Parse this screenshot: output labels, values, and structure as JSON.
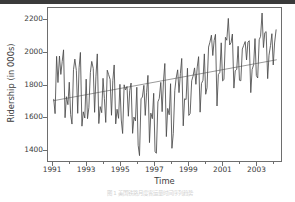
{
  "figure": {
    "background_color": "#ffffff",
    "axes_color": "#6e6e6e",
    "text_color": "#3b3b3b"
  },
  "caption": {
    "text": "图 1  美国铁路月度客运量时间序列趋势"
  },
  "chart_data": {
    "type": "line",
    "title": "",
    "xlabel": "Time",
    "ylabel": "Ridership (in 000s)",
    "xlim": [
      1990.7,
      2004.5
    ],
    "ylim": [
      1330,
      2270
    ],
    "grid": false,
    "legend": "none",
    "xticks": [
      1991,
      1993,
      1995,
      1997,
      1999,
      2001,
      2003
    ],
    "xticks_minor": [
      1992,
      1994,
      1996,
      1998,
      2000,
      2002,
      2004
    ],
    "yticks": [
      1400,
      1600,
      1800,
      2000,
      2200
    ],
    "series": [
      {
        "name": "Ridership",
        "color": "#4a4a4a",
        "linewidth": 0.85,
        "x": [
          1991.04,
          1991.12,
          1991.21,
          1991.29,
          1991.38,
          1991.46,
          1991.54,
          1991.62,
          1991.71,
          1991.79,
          1991.88,
          1991.96,
          1992.04,
          1992.12,
          1992.21,
          1992.29,
          1992.38,
          1992.46,
          1992.54,
          1992.62,
          1992.71,
          1992.79,
          1992.88,
          1992.96,
          1993.04,
          1993.12,
          1993.21,
          1993.29,
          1993.38,
          1993.46,
          1993.54,
          1993.62,
          1993.71,
          1993.79,
          1993.88,
          1993.96,
          1994.04,
          1994.12,
          1994.21,
          1994.29,
          1994.38,
          1994.46,
          1994.54,
          1994.62,
          1994.71,
          1994.79,
          1994.88,
          1994.96,
          1995.04,
          1995.12,
          1995.21,
          1995.29,
          1995.38,
          1995.46,
          1995.54,
          1995.62,
          1995.71,
          1995.79,
          1995.88,
          1995.96,
          1996.04,
          1996.12,
          1996.21,
          1996.29,
          1996.38,
          1996.46,
          1996.54,
          1996.62,
          1996.71,
          1996.79,
          1996.88,
          1996.96,
          1997.04,
          1997.12,
          1997.21,
          1997.29,
          1997.38,
          1997.46,
          1997.54,
          1997.62,
          1997.71,
          1997.79,
          1997.88,
          1997.96,
          1998.04,
          1998.12,
          1998.21,
          1998.29,
          1998.38,
          1998.46,
          1998.54,
          1998.62,
          1998.71,
          1998.79,
          1998.88,
          1998.96,
          1999.04,
          1999.12,
          1999.21,
          1999.29,
          1999.38,
          1999.46,
          1999.54,
          1999.62,
          1999.71,
          1999.79,
          1999.88,
          1999.96,
          2000.04,
          2000.12,
          2000.21,
          2000.29,
          2000.38,
          2000.46,
          2000.54,
          2000.62,
          2000.71,
          2000.79,
          2000.88,
          2000.96,
          2001.04,
          2001.12,
          2001.21,
          2001.29,
          2001.38,
          2001.46,
          2001.54,
          2001.62,
          2001.71,
          2001.79,
          2001.88,
          2001.96,
          2002.04,
          2002.12,
          2002.21,
          2002.29,
          2002.38,
          2002.46,
          2002.54,
          2002.62,
          2002.71,
          2002.79,
          2002.88,
          2002.96,
          2003.04,
          2003.12,
          2003.21,
          2003.29,
          2003.38,
          2003.46,
          2003.54,
          2003.62,
          2003.71,
          2003.79,
          2003.88,
          2003.96,
          2004.04,
          2004.12,
          2004.21
        ],
        "values": [
          1709,
          1621,
          1973,
          1812,
          1975,
          1862,
          1940,
          2013,
          1596,
          1725,
          1676,
          1814,
          1615,
          1557,
          1891,
          1956,
          1885,
          1623,
          1903,
          1997,
          1544,
          1632,
          1594,
          1833,
          1590,
          1657,
          1874,
          1942,
          1898,
          1629,
          1851,
          1988,
          1560,
          1664,
          1627,
          1838,
          1713,
          1567,
          1888,
          1861,
          1831,
          1611,
          1825,
          1920,
          1558,
          1648,
          1592,
          1801,
          1582,
          1499,
          1798,
          1767,
          1788,
          1605,
          1763,
          1809,
          1500,
          1600,
          1576,
          1783,
          1427,
          1363,
          1712,
          1723,
          1795,
          1610,
          1752,
          1856,
          1443,
          1624,
          1590,
          1746,
          1386,
          1378,
          1694,
          1714,
          1813,
          1633,
          1822,
          1929,
          1480,
          1653,
          1614,
          1805,
          1408,
          1500,
          1764,
          1839,
          1890,
          1750,
          1866,
          1960,
          1546,
          1712,
          1708,
          1900,
          1610,
          1622,
          1823,
          1851,
          1902,
          1801,
          1908,
          1971,
          1630,
          1806,
          1826,
          1988,
          1740,
          1780,
          2030,
          2060,
          2103,
          1978,
          2070,
          2108,
          1668,
          1861,
          1875,
          2056,
          1822,
          1830,
          2090,
          2072,
          2206,
          2043,
          2057,
          2110,
          1778,
          1885,
          1893,
          2035,
          1826,
          1823,
          2018,
          2040,
          2064,
          1951,
          2060,
          2069,
          1750,
          1892,
          1922,
          2082,
          1855,
          1840,
          2075,
          2096,
          2239,
          2027,
          2118,
          2125,
          1836,
          1980,
          2040,
          2112,
          1920,
          2055,
          2136
        ]
      }
    ],
    "trendline": {
      "name": "Linear trend",
      "color": "#8e8e8e",
      "linewidth": 0.9,
      "x": [
        1991.0,
        2004.25
      ],
      "values": [
        1700,
        1952
      ]
    }
  }
}
